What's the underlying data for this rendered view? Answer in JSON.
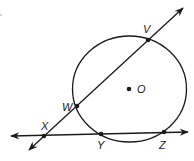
{
  "diagram": {
    "type": "geometry",
    "colors": {
      "stroke": "#1a1a1a",
      "background": "#ffffff"
    },
    "circle": {
      "center_label": "O",
      "cx": 129.5,
      "cy": 89,
      "rx": 57,
      "ry": 53
    },
    "points": [
      {
        "label": "V",
        "x": 148,
        "y": 40,
        "label_x": 143,
        "label_y": 33
      },
      {
        "label": "W",
        "x": 77,
        "y": 106,
        "label_x": 62,
        "label_y": 111
      },
      {
        "label": "X",
        "x": 44,
        "y": 136,
        "label_x": 41,
        "label_y": 130
      },
      {
        "label": "Y",
        "x": 101,
        "y": 134,
        "label_x": 97,
        "label_y": 149
      },
      {
        "label": "Z",
        "x": 164,
        "y": 132,
        "label_x": 159,
        "label_y": 149
      },
      {
        "label": "O",
        "x": 129,
        "y": 89,
        "label_x": 137,
        "label_y": 93
      }
    ],
    "lines": [
      {
        "name": "secant-XV",
        "through": [
          "X",
          "W",
          "V"
        ],
        "x1": 29,
        "y1": 150,
        "x2": 183,
        "y2": 8,
        "arrows": "both"
      },
      {
        "name": "secant-XZ",
        "through": [
          "X",
          "Y",
          "Z"
        ],
        "x1": 11,
        "y1": 136,
        "x2": 188,
        "y2": 132,
        "arrows": "both"
      }
    ]
  }
}
